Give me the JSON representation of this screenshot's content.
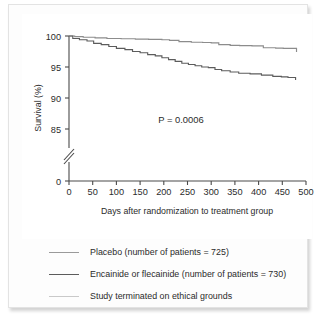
{
  "chart_data": {
    "type": "line",
    "title": "",
    "subtitle": "",
    "xlabel": "Days after randomization to treatment group",
    "ylabel": "Survival (%)",
    "xlim": [
      0,
      500
    ],
    "ylim": [
      83.5,
      100.5
    ],
    "xticks": [
      0,
      50,
      100,
      150,
      200,
      250,
      300,
      350,
      400,
      450,
      500
    ],
    "xtick_labels": [
      "0",
      "50",
      "100",
      "150",
      "200",
      "250",
      "300",
      "350",
      "400",
      "450",
      "500"
    ],
    "yticks": [
      85,
      90,
      95,
      100
    ],
    "ytick_labels": [
      "85",
      "90",
      "95",
      "100"
    ],
    "y_zero_tick_label": "0",
    "y_axis_break": true,
    "grid": false,
    "legend_position": "below-plot",
    "annotations": [
      {
        "text": "P = 0.0006",
        "x": 230,
        "y": 88.6
      }
    ],
    "series": [
      {
        "name": "Placebo (number of patients = 725)",
        "color": "#8c8c8c",
        "n_patients": 725,
        "step": "post",
        "x": [
          0,
          12,
          30,
          55,
          80,
          110,
          140,
          168,
          196,
          212,
          232,
          258,
          282,
          300,
          316,
          340,
          360,
          386,
          410,
          436,
          452,
          468,
          480
        ],
        "y": [
          100.0,
          99.9,
          99.8,
          99.7,
          99.6,
          99.55,
          99.5,
          99.45,
          99.4,
          99.3,
          99.1,
          99.0,
          98.95,
          98.9,
          98.6,
          98.5,
          98.45,
          98.4,
          98.1,
          98.05,
          98.0,
          98.0,
          97.4
        ]
      },
      {
        "name": "Encainide or flecainide (number of patients = 730)",
        "color": "#5c5c5c",
        "n_patients": 730,
        "step": "post",
        "x": [
          0,
          8,
          22,
          38,
          52,
          68,
          84,
          100,
          118,
          134,
          150,
          166,
          182,
          196,
          210,
          224,
          238,
          252,
          266,
          280,
          294,
          308,
          322,
          340,
          358,
          382,
          406,
          430,
          448,
          462,
          478
        ],
        "y": [
          100.0,
          99.6,
          99.4,
          99.2,
          98.8,
          98.6,
          98.3,
          98.0,
          97.8,
          97.5,
          97.3,
          97.0,
          96.8,
          96.5,
          96.2,
          95.9,
          95.6,
          95.4,
          95.2,
          95.0,
          94.9,
          94.6,
          94.4,
          94.2,
          94.0,
          93.9,
          93.7,
          93.5,
          93.4,
          93.3,
          92.9
        ]
      }
    ]
  },
  "legend": {
    "items": [
      {
        "label": "Placebo (number of patients = 725)",
        "color": "#9a9a9a"
      },
      {
        "label": "Encainide or flecainide (number of patients = 730)",
        "color": "#5c5c5c"
      },
      {
        "label": "Study terminated on ethical grounds",
        "color": "#c9c9c9"
      }
    ]
  },
  "axes": {
    "xlabel": "Days after randomization to treatment group",
    "ylabel": "Survival (%)"
  },
  "annotation": {
    "p_value": "P = 0.0006"
  },
  "colors": {
    "axis": "#4a4a4a",
    "text": "#2b2b2b",
    "panel_bg": "#fdfdfd",
    "plot_bg": "#ffffff",
    "placebo": "#9a9a9a",
    "treatment": "#5c5c5c",
    "terminated": "#c9c9c9"
  }
}
